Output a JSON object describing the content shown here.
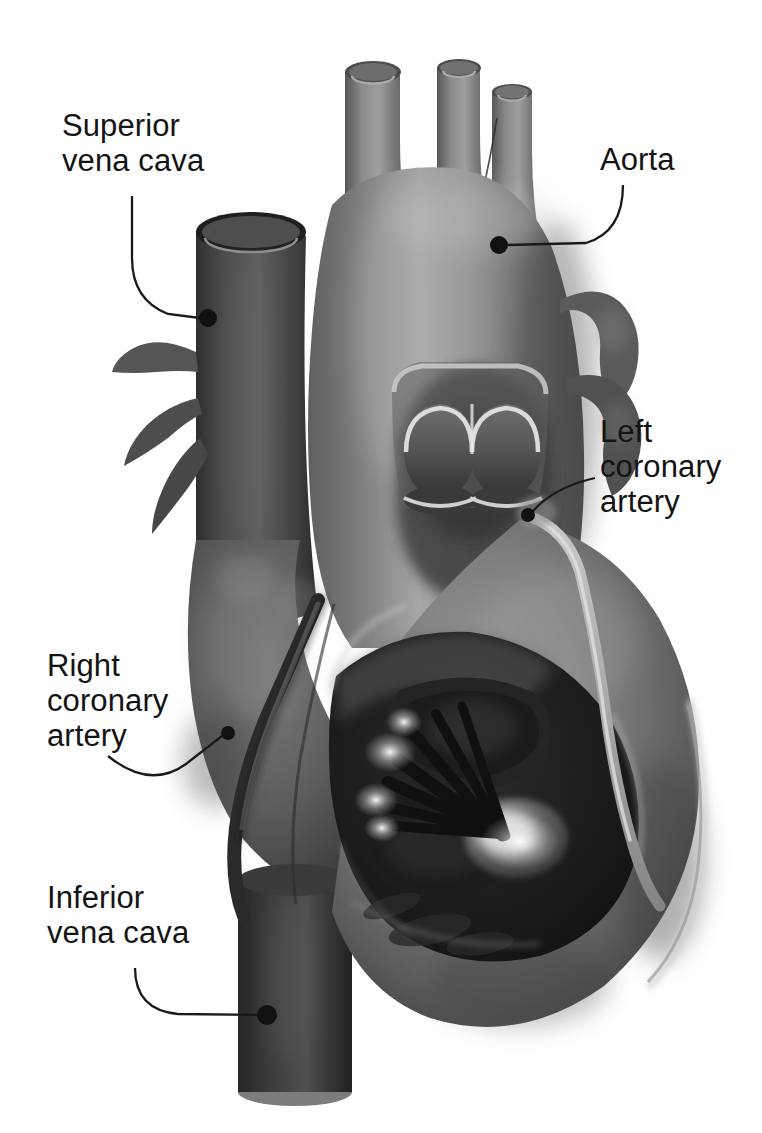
{
  "figure": {
    "background_color": "#ffffff",
    "text_color": "#141414",
    "leader_color": "#1a1a1a",
    "width": 762,
    "height": 1133
  },
  "labels": [
    {
      "id": "superior-vena-cava",
      "text": "Superior\nvena cava",
      "lines": [
        "Superior",
        "vena cava"
      ],
      "x": 62,
      "y": 108,
      "align": "left",
      "marker": {
        "x": 208,
        "y": 318
      },
      "leader_path": "M 132 196 L 132 258 Q 132 300 168 314 L 200 318"
    },
    {
      "id": "aorta",
      "text": "Aorta",
      "lines": [
        "Aorta"
      ],
      "x": 600,
      "y": 142,
      "align": "left",
      "marker": {
        "x": 499,
        "y": 245
      },
      "leader_path": "M 623 185 Q 623 232 586 243 L 508 245"
    },
    {
      "id": "left-coronary-artery",
      "text": "Left\ncoronary\nartery",
      "lines": [
        "Left",
        "coronary",
        "artery"
      ],
      "x": 600,
      "y": 414,
      "align": "left",
      "marker": {
        "x": 528,
        "y": 515
      },
      "leader_path": "M 595 478 Q 560 486 540 504 L 531 513"
    },
    {
      "id": "right-coronary-artery",
      "text": "Right\ncoronary\nartery",
      "lines": [
        "Right",
        "coronary",
        "artery"
      ],
      "x": 47,
      "y": 648,
      "align": "left",
      "marker": {
        "x": 228,
        "y": 733
      },
      "leader_path": "M 108 756 Q 150 790 186 764 L 222 736"
    },
    {
      "id": "inferior-vena-cava",
      "text": "Inferior\nvena cava",
      "lines": [
        "Inferior",
        "vena cava"
      ],
      "x": 47,
      "y": 880,
      "align": "left",
      "marker": {
        "x": 267,
        "y": 1015
      },
      "leader_path": "M 135 968 Q 135 1010 178 1014 L 259 1015"
    }
  ],
  "anatomy": {
    "structures": [
      "aortic arch",
      "brachiocephalic trunk",
      "left common carotid artery",
      "left subclavian artery",
      "superior vena cava",
      "inferior vena cava",
      "pulmonary veins",
      "aortic valve cusps",
      "left coronary artery",
      "right coronary artery",
      "left ventricle",
      "papillary muscle",
      "chordae tendineae",
      "mitral valve leaflet",
      "myocardium"
    ],
    "palette": {
      "white": "#ffffff",
      "light_gray": "#cfcfcf",
      "mid_gray": "#8e8e8e",
      "gray": "#707070",
      "dark_gray": "#4a4a4a",
      "darker_gray": "#333333",
      "near_black": "#1c1c1c",
      "highlight": "#efefef"
    },
    "style": "grayscale airbrush medical illustration"
  }
}
